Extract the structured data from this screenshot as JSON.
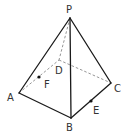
{
  "figure": {
    "type": "pyramid",
    "colors": {
      "solid_edge": "#1a1a1a",
      "hidden_edge": "#8a8a8a",
      "label": "#333333"
    },
    "vertices": {
      "P": {
        "label": "P",
        "x": 70,
        "y": 18
      },
      "A": {
        "label": "A",
        "x": 19,
        "y": 93
      },
      "B": {
        "label": "B",
        "x": 71,
        "y": 118
      },
      "C": {
        "label": "C",
        "x": 111,
        "y": 83
      },
      "D": {
        "label": "D",
        "x": 59,
        "y": 60
      }
    },
    "points": {
      "F": {
        "label": "F",
        "on_segment": "AD",
        "x": 39,
        "y": 77
      },
      "E": {
        "label": "E",
        "on_segment": "BC",
        "x": 91,
        "y": 101
      }
    },
    "edges_visible": [
      "PA",
      "PB",
      "PC",
      "AB",
      "BC"
    ],
    "edges_hidden": [
      "PD",
      "AD",
      "DC"
    ]
  }
}
